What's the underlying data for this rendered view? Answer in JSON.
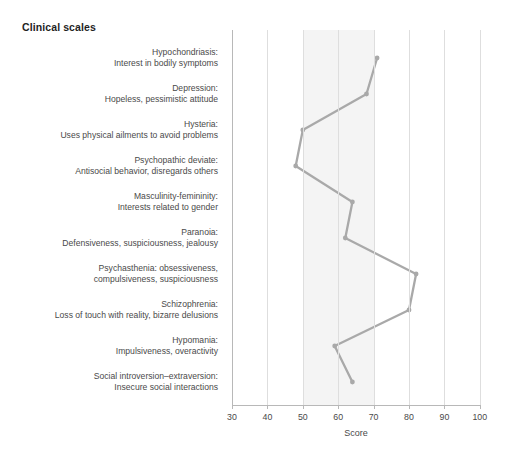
{
  "title": "Clinical scales",
  "axis": {
    "xlabel": "Score",
    "ticks": [
      30,
      40,
      50,
      60,
      70,
      80,
      90,
      100
    ],
    "xmin": 30,
    "xmax": 100
  },
  "band": {
    "from": 50,
    "to": 70,
    "color": "#f4f4f4"
  },
  "style": {
    "line_color": "#a9a9a9",
    "grid_color": "#dedede",
    "axis_color": "#b8b8b8",
    "text_color": "#4a4a4a",
    "title_color": "#1f1f1f"
  },
  "chart_data": {
    "type": "line",
    "title": "Clinical scales",
    "xlabel": "Score",
    "ylabel": "",
    "xlim": [
      30,
      100
    ],
    "grid": true,
    "orientation": "horizontal",
    "legend": "none",
    "categories": [
      "Hypochondriasis: Interest in bodily symptoms",
      "Depression: Hopeless, pessimistic attitude",
      "Hysteria: Uses physical ailments to avoid problems",
      "Psychopathic deviate: Antisocial behavior, disregards others",
      "Masculinity-femininity: Interests related to gender",
      "Paranoia: Defensiveness, suspiciousness, jealousy",
      "Psychasthenia: obsessiveness, compulsiveness, suspiciousness",
      "Schizophrenia: Loss of touch with reality, bizarre delusions",
      "Hypomania: Impulsiveness, overactivity",
      "Social introversion-extraversion: Insecure social interactions"
    ],
    "values": [
      71,
      68,
      50,
      48,
      64,
      62,
      82,
      80,
      59,
      64
    ]
  },
  "rows": [
    {
      "line1": "Hypochondriasis:",
      "line2": "Interest in bodily symptoms"
    },
    {
      "line1": "Depression:",
      "line2": "Hopeless, pessimistic attitude"
    },
    {
      "line1": "Hysteria:",
      "line2": "Uses physical ailments to avoid problems"
    },
    {
      "line1": "Psychopathic deviate:",
      "line2": "Antisocial behavior, disregards others"
    },
    {
      "line1": "Masculinity-femininity:",
      "line2": "Interests related to gender"
    },
    {
      "line1": "Paranoia:",
      "line2": "Defensiveness, suspiciousness, jealousy"
    },
    {
      "line1": "Psychasthenia: obsessiveness,",
      "line2": "compulsiveness, suspiciousness"
    },
    {
      "line1": "Schizophrenia:",
      "line2": "Loss of touch with reality, bizarre delusions"
    },
    {
      "line1": "Hypomania:",
      "line2": "Impulsiveness, overactivity"
    },
    {
      "line1": "Social introversion–extraversion:",
      "line2": "Insecure social interactions"
    }
  ]
}
